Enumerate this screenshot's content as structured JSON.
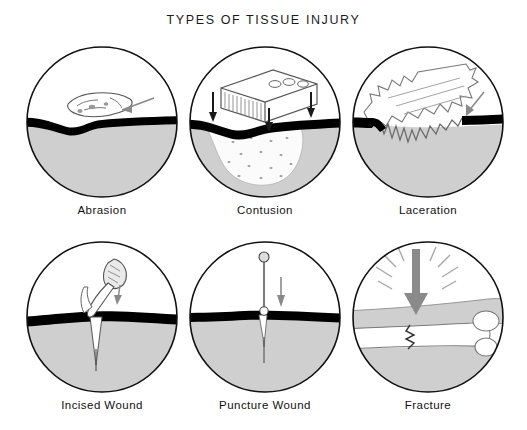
{
  "figure": {
    "title": "TYPES OF TISSUE INJURY",
    "background": "#ffffff",
    "layout": {
      "columns": 3,
      "rows": 2,
      "panel_count": 6
    }
  },
  "colors": {
    "outline": "#111111",
    "skin_line": "#000000",
    "tissue_gray": "#cfcfcf",
    "bruise_fill": "#fbfbfb",
    "arrow_gray": "#8a8a8a",
    "bone_white": "#ffffff",
    "text": "#111111"
  },
  "panels": [
    {
      "id": "abrasion",
      "label": "Abrasion",
      "row": 0,
      "column": 0,
      "description": "Scraped superficial tissue flap above the skin line with a shearing arrow pointing left",
      "injury_agent": "scraping force",
      "arrows": 1,
      "arrow_direction": "left",
      "depth": "superficial"
    },
    {
      "id": "contusion",
      "label": "Contusion",
      "row": 0,
      "column": 1,
      "description": "Brick with three holes striking downward, stippled bruise spreading beneath intact skin",
      "injury_agent": "blunt object (brick)",
      "arrows": 3,
      "arrow_direction": "down",
      "depth": "deep, skin intact"
    },
    {
      "id": "laceration",
      "label": "Laceration",
      "row": 0,
      "column": 2,
      "description": "Jagged torn flap of tissue with ragged irregular wound edges and an arrow at right",
      "injury_agent": "tearing force",
      "arrows": 1,
      "arrow_direction": "down-left",
      "depth": "through skin, irregular"
    },
    {
      "id": "incised-wound",
      "label": "Incised Wound",
      "row": 1,
      "column": 0,
      "description": "Scalpel blade making a clean narrow vertical cut through skin into deep tissue",
      "injury_agent": "sharp blade (scalpel)",
      "arrows": 1,
      "arrow_direction": "down",
      "depth": "deep, clean edges"
    },
    {
      "id": "puncture-wound",
      "label": "Puncture Wound",
      "row": 1,
      "column": 1,
      "description": "Pin with round head driven straight down through the skin leaving a narrow deep track",
      "injury_agent": "pointed object (pin/nail)",
      "arrows": 1,
      "arrow_direction": "down",
      "depth": "narrow and deep"
    },
    {
      "id": "fracture",
      "label": "Fracture",
      "row": 1,
      "column": 2,
      "description": "Heavy downward impact arrow with radiating force lines cracking a long bone with rounded end",
      "injury_agent": "impact force",
      "arrows": 1,
      "arrow_direction": "down",
      "depth": "bone broken"
    }
  ]
}
